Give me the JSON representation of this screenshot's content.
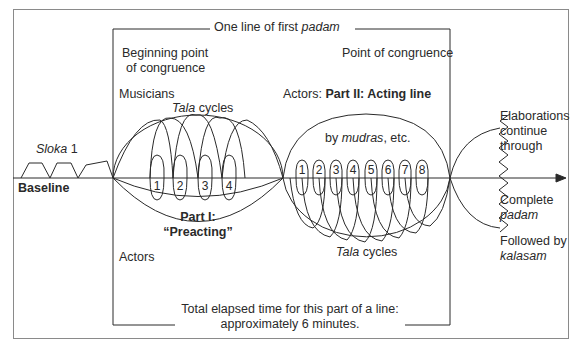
{
  "diagram": {
    "top_bracket": {
      "label_prefix": "One line of first ",
      "label_italic": "padam"
    },
    "labels": {
      "beginning_point_line1": "Beginning point",
      "beginning_point_line2": "of congruence",
      "point_of_congruence": "Point of congruence",
      "musicians": "Musicians",
      "tala_cycles_top_italic": "Tala",
      "tala_cycles_top_rest": " cycles",
      "actors_prefix": "Actors: ",
      "actors_part2_bold": "Part II: Acting line",
      "by_prefix": "by ",
      "by_mudras_italic": "mudras",
      "by_suffix": ", etc.",
      "sloka_italic": "Sloka",
      "sloka_rest": " 1",
      "baseline": "Baseline",
      "part1_line1": "Part I:",
      "part1_line2": "“Preacting”",
      "actors_bottom": "Actors",
      "tala_cycles_bottom_italic": "Tala",
      "tala_cycles_bottom_rest": " cycles",
      "elaborations_line1": "Elaborations",
      "elaborations_line2": "continue",
      "elaborations_line3": "through",
      "complete_line1": "Complete",
      "complete_line2_italic": "padam",
      "followed_line1": "Followed by",
      "followed_line2_italic": "kalasam",
      "total_time_line1": "Total elapsed time for this part of a line:",
      "total_time_line2": "approximately 6 minutes."
    },
    "part1_cycle_numbers": [
      "1",
      "2",
      "3",
      "4"
    ],
    "part2_cycle_numbers": [
      "1",
      "2",
      "3",
      "4",
      "5",
      "6",
      "7",
      "8"
    ],
    "colors": {
      "line": "#2a2a2a",
      "frame": "#8a8a8a",
      "background": "#ffffff"
    }
  }
}
